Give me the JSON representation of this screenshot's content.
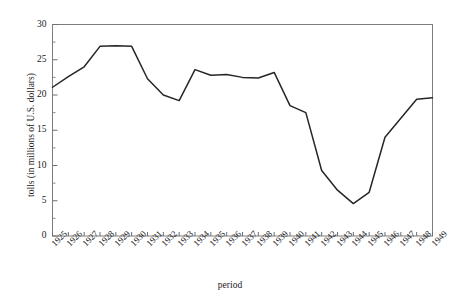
{
  "chart_data": {
    "type": "line",
    "title": "",
    "xlabel": "period",
    "ylabel": "tolls (in millions of U.S. dollars)",
    "ylim": [
      0,
      30
    ],
    "yticks": [
      0,
      5,
      10,
      15,
      20,
      25,
      30
    ],
    "ytick_labels": [
      "0",
      "5",
      "10",
      "15",
      "20",
      "25",
      "30"
    ],
    "y_minor_ticks": [
      2.5,
      7.5,
      12.5,
      17.5,
      22.5,
      27.5
    ],
    "grid": false,
    "legend": "none",
    "categories": [
      "1925",
      "1926",
      "1927",
      "1928",
      "1929",
      "1930",
      "1931",
      "1932",
      "1933",
      "1934",
      "1935",
      "1936",
      "1937",
      "1938",
      "1939",
      "1940",
      "1941",
      "1942",
      "1943",
      "1944",
      "1945",
      "1946",
      "1947",
      "1948",
      "1949"
    ],
    "values": [
      21.1,
      22.6,
      24.0,
      26.9,
      27.0,
      26.9,
      22.3,
      20.0,
      19.2,
      23.6,
      22.8,
      22.9,
      22.5,
      22.4,
      23.2,
      18.5,
      17.5,
      9.3,
      6.5,
      4.6,
      6.2,
      14.0,
      16.7,
      19.4,
      19.6
    ],
    "series": [
      {
        "name": "tolls",
        "color": "#262626",
        "values": [
          21.1,
          22.6,
          24.0,
          26.9,
          27.0,
          26.9,
          22.3,
          20.0,
          19.2,
          23.6,
          22.8,
          22.9,
          22.5,
          22.4,
          23.2,
          18.5,
          17.5,
          9.3,
          6.5,
          4.6,
          6.2,
          14.0,
          16.7,
          19.4,
          19.6
        ]
      }
    ]
  },
  "axes": {
    "y_title": "tolls (in millions of U.S. dollars)",
    "x_title": "period"
  },
  "header": {
    "title": ""
  }
}
